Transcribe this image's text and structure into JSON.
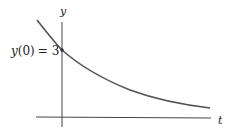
{
  "figure": {
    "type": "exponential-decay-graph",
    "axes": {
      "x_label": "t",
      "y_label": "y"
    },
    "annotation": {
      "text": "y(0) = 3",
      "fn": "y",
      "arg": "(0)",
      "eq": "= 3"
    },
    "colors": {
      "axis": "#333333",
      "curve": "#555555",
      "text": "#222222"
    }
  }
}
